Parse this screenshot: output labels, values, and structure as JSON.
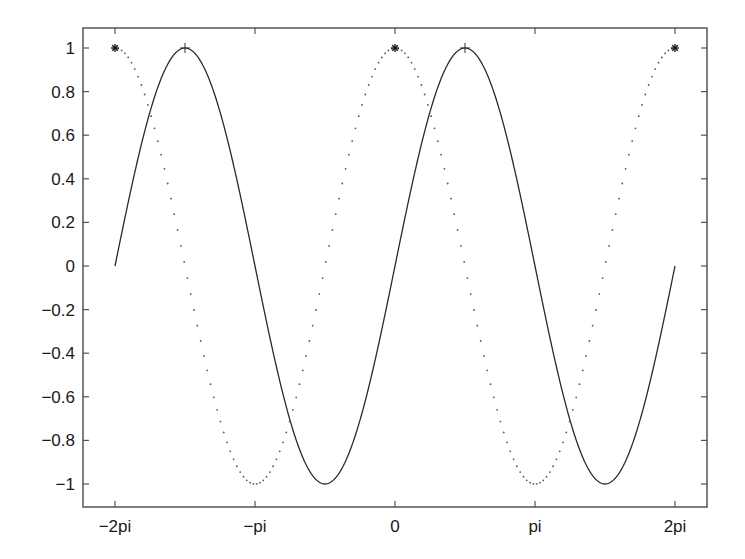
{
  "chart_data": {
    "type": "line",
    "title": "",
    "xlabel": "",
    "ylabel": "",
    "xlim": [
      -7.0,
      7.0
    ],
    "ylim": [
      -1.1,
      1.1
    ],
    "grid": false,
    "legend": null,
    "x_ticks": [
      {
        "value": -6.283185,
        "label": "−2pi"
      },
      {
        "value": -3.141593,
        "label": "−pi"
      },
      {
        "value": 0,
        "label": "0"
      },
      {
        "value": 3.141593,
        "label": "pi"
      },
      {
        "value": 6.283185,
        "label": "2pi"
      }
    ],
    "y_ticks": [
      {
        "value": 1,
        "label": "1"
      },
      {
        "value": 0.8,
        "label": "0.8"
      },
      {
        "value": 0.6,
        "label": "0.6"
      },
      {
        "value": 0.4,
        "label": "0.4"
      },
      {
        "value": 0.2,
        "label": "0.2"
      },
      {
        "value": 0,
        "label": "0"
      },
      {
        "value": -0.2,
        "label": "−0.2"
      },
      {
        "value": -0.4,
        "label": "−0.4"
      },
      {
        "value": -0.6,
        "label": "−0.6"
      },
      {
        "value": -0.8,
        "label": "−0.8"
      },
      {
        "value": -1,
        "label": "−1"
      }
    ],
    "series": [
      {
        "name": "sin(x)",
        "function": "sin",
        "x_range": [
          -6.283185,
          6.283185
        ],
        "line_style": "solid",
        "color": "#2a2a2a",
        "markers": [
          {
            "x": -4.712389,
            "y": 1,
            "symbol": "+"
          },
          {
            "x": 1.570796,
            "y": 1,
            "symbol": "+"
          }
        ],
        "key_points": [
          {
            "x": -6.283185,
            "y": 0
          },
          {
            "x": -4.712389,
            "y": 1
          },
          {
            "x": -3.141593,
            "y": 0
          },
          {
            "x": -1.570796,
            "y": -1
          },
          {
            "x": 0,
            "y": 0
          },
          {
            "x": 1.570796,
            "y": 1
          },
          {
            "x": 3.141593,
            "y": 0
          },
          {
            "x": 4.712389,
            "y": -1
          },
          {
            "x": 6.283185,
            "y": 0
          }
        ]
      },
      {
        "name": "cos(x)",
        "function": "cos",
        "x_range": [
          -6.283185,
          6.283185
        ],
        "line_style": "dotted",
        "color": "#555555",
        "markers": [
          {
            "x": -6.283185,
            "y": 1,
            "symbol": "*"
          },
          {
            "x": 0,
            "y": 1,
            "symbol": "*"
          },
          {
            "x": 6.283185,
            "y": 1,
            "symbol": "*"
          }
        ],
        "key_points": [
          {
            "x": -6.283185,
            "y": 1
          },
          {
            "x": -4.712389,
            "y": 0
          },
          {
            "x": -3.141593,
            "y": -1
          },
          {
            "x": -1.570796,
            "y": 0
          },
          {
            "x": 0,
            "y": 1
          },
          {
            "x": 1.570796,
            "y": 0
          },
          {
            "x": 3.141593,
            "y": -1
          },
          {
            "x": 4.712389,
            "y": 0
          },
          {
            "x": 6.283185,
            "y": 1
          }
        ]
      }
    ]
  },
  "layout": {
    "plot_box": {
      "left": 83,
      "top": 28,
      "right": 707,
      "bottom": 507
    },
    "x_px_per_unit": 44.563,
    "x_zero_px": 395,
    "y_zero_px": 266,
    "y_px_per_unit": 218
  }
}
